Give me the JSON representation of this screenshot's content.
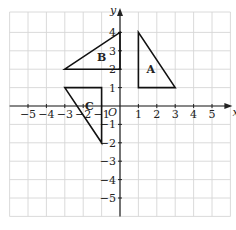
{
  "diagram": {
    "type": "coordinate-grid",
    "x_range": [
      -6,
      6
    ],
    "y_range": [
      -6,
      4.5
    ],
    "axis_labels": {
      "x": "x",
      "y": "y",
      "origin": "O"
    },
    "x_ticks": [
      "-5",
      "-4",
      "-3",
      "-2",
      "-1",
      "1",
      "2",
      "3",
      "4",
      "5"
    ],
    "y_ticks": [
      "4",
      "3",
      "2",
      "1",
      "-1",
      "-2",
      "-3",
      "-4",
      "-5"
    ],
    "colors": {
      "grid": "#d6d6d6",
      "axis": "#222222",
      "shape": "#111111"
    },
    "shapes": [
      {
        "label": "A",
        "vertices": [
          [
            1,
            4
          ],
          [
            1,
            1
          ],
          [
            3,
            1
          ]
        ]
      },
      {
        "label": "B",
        "vertices": [
          [
            -3,
            2
          ],
          [
            0,
            4
          ],
          [
            0,
            2
          ]
        ]
      },
      {
        "label": "C",
        "vertices": [
          [
            -3,
            1
          ],
          [
            -1,
            1
          ],
          [
            -1,
            -2
          ]
        ]
      }
    ]
  }
}
